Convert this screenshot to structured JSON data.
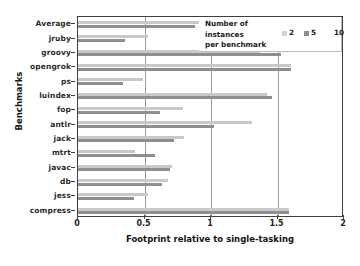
{
  "chart_data": {
    "type": "bar",
    "orientation": "horizontal",
    "title": "",
    "xlabel": "Footprint relative to single-tasking",
    "ylabel": "Benchmarks",
    "xlim": [
      0,
      2
    ],
    "xticks": [
      "0",
      "0.5",
      "1",
      "1.5",
      "2"
    ],
    "xtick_values": [
      0,
      0.5,
      1,
      1.5,
      2
    ],
    "gridlines": [
      0.5,
      1,
      1.5
    ],
    "grid": true,
    "legend_position": "top-right",
    "legend_title": [
      "Number of",
      "instances",
      "per benchmark"
    ],
    "categories": [
      "Average",
      "jruby",
      "groovy",
      "opengrok",
      "ps",
      "luindex",
      "fop",
      "antlr",
      "jack",
      "mtrt",
      "javac",
      "db",
      "jess",
      "compress"
    ],
    "series": [
      {
        "name": "2",
        "color": "#c9c9c9",
        "values": [
          0.93,
          0.53,
          1.37,
          1.6,
          0.49,
          1.42,
          0.79,
          1.31,
          0.8,
          0.43,
          0.71,
          0.68,
          0.53,
          1.59
        ]
      },
      {
        "name": "5",
        "color": "#8f8f8f",
        "values": [
          0.88,
          0.35,
          1.53,
          1.6,
          0.34,
          1.46,
          0.62,
          1.02,
          0.72,
          0.58,
          0.69,
          0.63,
          0.42,
          1.59
        ]
      },
      {
        "name": "10",
        "color": "#ffffff",
        "values": [
          0,
          0,
          0,
          0,
          0,
          0,
          0,
          0,
          0,
          0,
          0,
          0,
          0,
          0
        ]
      }
    ]
  },
  "legend": {
    "title_line1": "Number of",
    "title_line2": "instances",
    "title_line3": "per benchmark",
    "items": [
      {
        "label": "2",
        "color": "#d2d2d2"
      },
      {
        "label": "5",
        "color": "#8f8f8f"
      },
      {
        "label": "10",
        "color": "#ffffff"
      }
    ]
  },
  "axes": {
    "x_title": "Footprint relative to single-tasking",
    "y_title": "Benchmarks"
  }
}
